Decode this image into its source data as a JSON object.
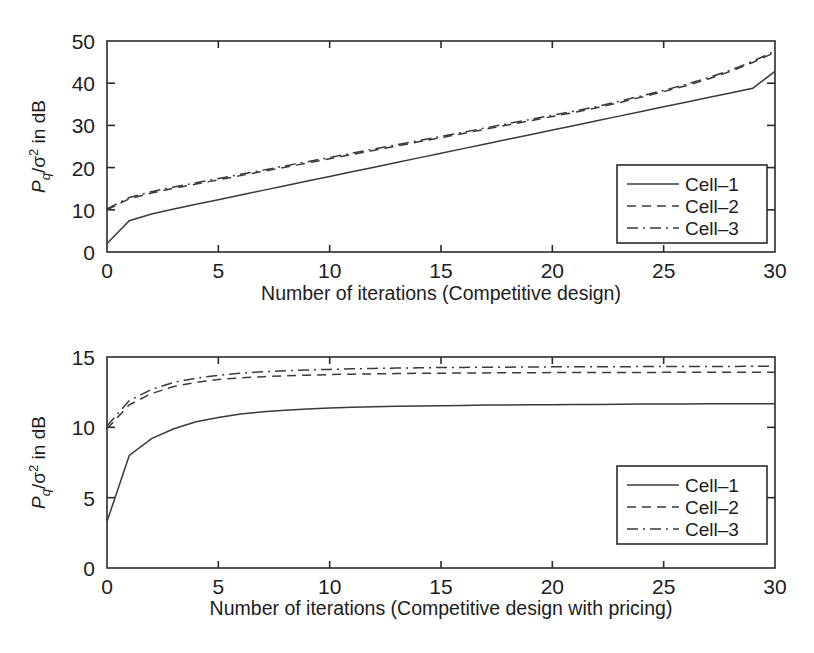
{
  "figure": {
    "background": "#ffffff",
    "ink_color": "#2b2b2b",
    "curve_color": "#3a3a3a"
  },
  "chart_data": [
    {
      "id": "top-chart",
      "type": "line",
      "title": "",
      "xlabel": "Number of iterations (Competitive design)",
      "ylabel": "P_q/σ² in dB",
      "ylabel_parts": {
        "main": "P",
        "sub": "q",
        "div": "/",
        "sigma": "σ",
        "sup": "2",
        "tail": " in dB"
      },
      "xlim": [
        0,
        30
      ],
      "ylim": [
        0,
        50
      ],
      "xticks": [
        0,
        5,
        10,
        15,
        20,
        25,
        30
      ],
      "yticks": [
        0,
        10,
        20,
        30,
        40,
        50
      ],
      "xticklabels": [
        "0",
        "5",
        "10",
        "15",
        "20",
        "25",
        "30"
      ],
      "yticklabels": [
        "0",
        "10",
        "20",
        "30",
        "40",
        "50"
      ],
      "grid": false,
      "legend_position": "lower right",
      "x": [
        0,
        1,
        2,
        3,
        4,
        5,
        6,
        7,
        8,
        9,
        10,
        11,
        12,
        13,
        14,
        15,
        16,
        17,
        18,
        19,
        20,
        21,
        22,
        23,
        24,
        25,
        26,
        27,
        28,
        29,
        30
      ],
      "series": [
        {
          "name": "Cell–1",
          "style": "solid",
          "values": [
            2.0,
            7.4,
            9.0,
            10.2,
            11.3,
            12.4,
            13.5,
            14.6,
            15.7,
            16.8,
            17.9,
            19.0,
            20.1,
            21.2,
            22.3,
            23.4,
            24.5,
            25.6,
            26.7,
            27.8,
            28.9,
            30.0,
            31.1,
            32.2,
            33.3,
            34.4,
            35.5,
            36.6,
            37.7,
            38.8,
            42.8
          ]
        },
        {
          "name": "Cell–2",
          "style": "dashed",
          "values": [
            10.0,
            12.6,
            14.0,
            15.1,
            16.1,
            17.1,
            18.1,
            19.1,
            20.1,
            21.1,
            22.1,
            23.1,
            24.1,
            25.1,
            26.1,
            27.1,
            28.1,
            29.1,
            30.1,
            31.1,
            32.1,
            33.1,
            34.2,
            35.4,
            36.7,
            38.0,
            39.4,
            41.0,
            42.8,
            44.9,
            47.3
          ]
        },
        {
          "name": "Cell–3",
          "style": "dashdot",
          "values": [
            10.2,
            12.9,
            14.3,
            15.4,
            16.4,
            17.4,
            18.4,
            19.4,
            20.4,
            21.4,
            22.4,
            23.4,
            24.4,
            25.4,
            26.4,
            27.4,
            28.4,
            29.4,
            30.4,
            31.4,
            32.4,
            33.4,
            34.5,
            35.7,
            37.0,
            38.3,
            39.7,
            41.3,
            43.1,
            45.2,
            47.6
          ]
        }
      ],
      "legend": [
        "Cell–1",
        "Cell–2",
        "Cell–3"
      ]
    },
    {
      "id": "bottom-chart",
      "type": "line",
      "title": "",
      "xlabel": "Number of iterations (Competitive design with pricing)",
      "ylabel": "P_q/σ² in dB",
      "ylabel_parts": {
        "main": "P",
        "sub": "q",
        "div": "/",
        "sigma": "σ",
        "sup": "2",
        "tail": " in dB"
      },
      "xlim": [
        0,
        30
      ],
      "ylim": [
        0,
        15
      ],
      "xticks": [
        0,
        5,
        10,
        15,
        20,
        25,
        30
      ],
      "yticks": [
        0,
        5,
        10,
        15
      ],
      "xticklabels": [
        "0",
        "5",
        "10",
        "15",
        "20",
        "25",
        "30"
      ],
      "yticklabels": [
        "0",
        "5",
        "10",
        "15"
      ],
      "grid": false,
      "legend_position": "lower right",
      "x": [
        0,
        1,
        2,
        3,
        4,
        5,
        6,
        7,
        8,
        9,
        10,
        11,
        12,
        13,
        14,
        15,
        16,
        17,
        18,
        19,
        20,
        21,
        22,
        23,
        24,
        25,
        26,
        27,
        28,
        29,
        30
      ],
      "series": [
        {
          "name": "Cell–1",
          "style": "solid",
          "values": [
            3.3,
            8.0,
            9.2,
            9.9,
            10.4,
            10.7,
            10.95,
            11.1,
            11.22,
            11.3,
            11.37,
            11.42,
            11.46,
            11.49,
            11.52,
            11.54,
            11.56,
            11.58,
            11.59,
            11.6,
            11.61,
            11.62,
            11.63,
            11.64,
            11.65,
            11.66,
            11.66,
            11.67,
            11.67,
            11.68,
            11.68
          ]
        },
        {
          "name": "Cell–2",
          "style": "dashed",
          "values": [
            9.9,
            11.6,
            12.4,
            12.9,
            13.2,
            13.4,
            13.52,
            13.6,
            13.66,
            13.71,
            13.75,
            13.78,
            13.8,
            13.82,
            13.84,
            13.85,
            13.86,
            13.87,
            13.88,
            13.88,
            13.89,
            13.89,
            13.9,
            13.9,
            13.9,
            13.91,
            13.91,
            13.91,
            13.92,
            13.92,
            13.92
          ]
        },
        {
          "name": "Cell–3",
          "style": "dashdot",
          "values": [
            10.1,
            11.9,
            12.7,
            13.2,
            13.5,
            13.7,
            13.85,
            13.95,
            14.02,
            14.08,
            14.12,
            14.16,
            14.19,
            14.21,
            14.23,
            14.25,
            14.26,
            14.27,
            14.28,
            14.29,
            14.3,
            14.3,
            14.31,
            14.31,
            14.32,
            14.32,
            14.33,
            14.33,
            14.33,
            14.34,
            14.34
          ]
        }
      ],
      "legend": [
        "Cell–1",
        "Cell–2",
        "Cell–3"
      ]
    }
  ]
}
